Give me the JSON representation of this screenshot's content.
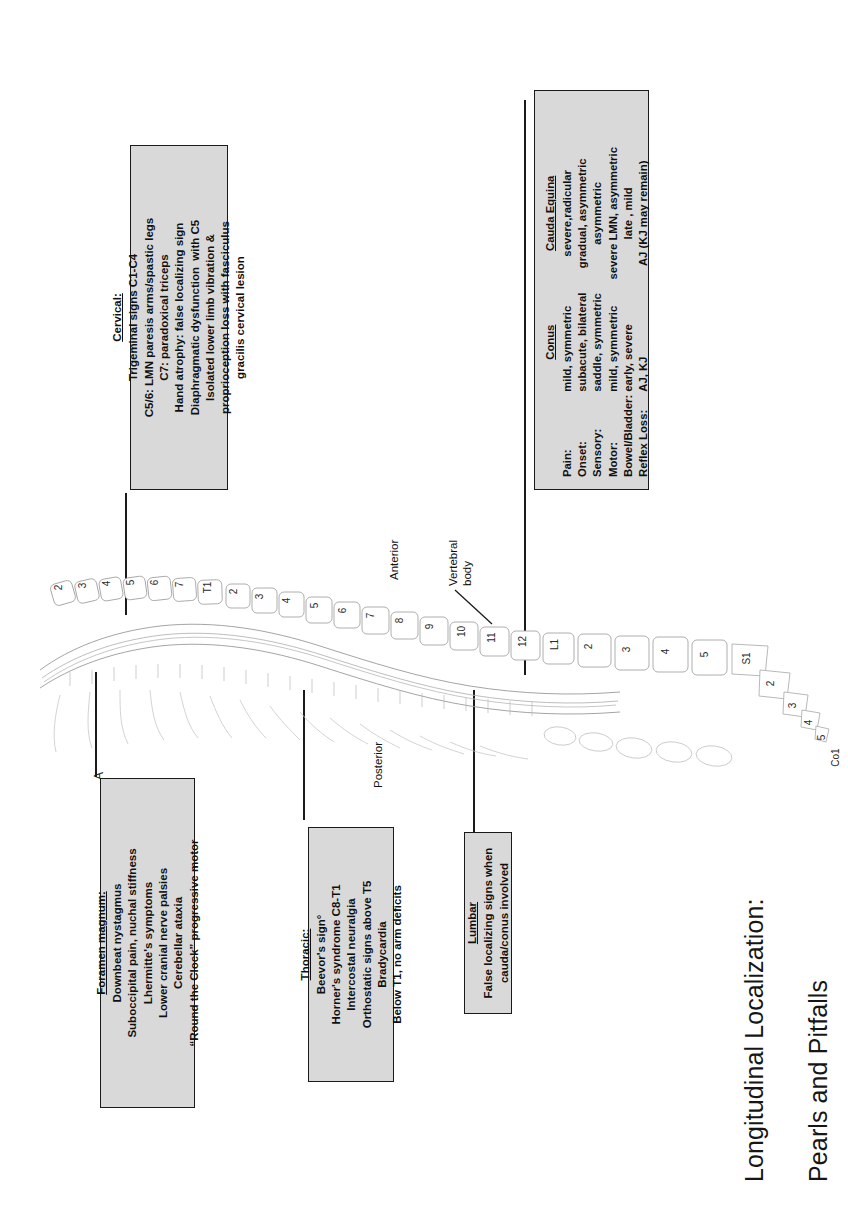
{
  "title": {
    "line1": "Longitudinal Localization:",
    "line2": "Pearls and Pitfalls"
  },
  "panel_letter": "A",
  "boxes": {
    "foramen_magnum": {
      "heading": "Foramen magnum:",
      "lines": [
        "Downbeat nystagmus",
        "Suboccipital pain, nuchal stiffness",
        "Lhermitte's symptoms",
        "Lower cranial nerve palsies",
        "Cerebellar ataxia",
        "“Round the Clock” progressive motor"
      ]
    },
    "thoracic": {
      "heading": "Thoracic:",
      "lines": [
        "Beevor's sign°",
        "Horner's syndrome C8-T1",
        "Intercostal neuralgia",
        "Orthostatic signs above T5",
        "Bradycardia",
        "Below T1, no arm deficits"
      ]
    },
    "lumbar": {
      "heading": "Lumbar",
      "lines": [
        "False localizing signs when",
        "cauda/conus involved"
      ]
    },
    "cervical": {
      "heading": "Cervical:",
      "lines": [
        "Trigeminal signs C1-C4",
        "C5/6: LMN paresis arms/spastic legs",
        "C7: paradoxical triceps",
        "Hand atrophy: false localizing sign",
        "Diaphragmatic dysfunction  with C5",
        "Isolated lower limb vibration &",
        "proprioception loss with fasciculus",
        "gracilis cervical lesion"
      ]
    },
    "conus_cauda": {
      "col1_heading": "Conus",
      "col2_heading": "Cauda Equina",
      "rows": [
        {
          "label": "Pain:",
          "conus": "mild, symmetric",
          "cauda": "severe,radicular"
        },
        {
          "label": "Onset:",
          "conus": "subacute, bilateral",
          "cauda": "gradual, asymmetric"
        },
        {
          "label": "Sensory:",
          "conus": "saddle, symmetric",
          "cauda": "asymmetric"
        },
        {
          "label": "Motor:",
          "conus": "mild, symmetric",
          "cauda": "severe LMN, asymmetric"
        },
        {
          "label": "Bowel/Bladder:",
          "conus": "early, severe",
          "cauda": "late , mild"
        },
        {
          "label": "Reflex Loss:",
          "conus": "AJ, KJ",
          "cauda": "AJ (KJ may remain)"
        }
      ]
    }
  },
  "spine": {
    "anterior_label": "Anterior",
    "posterior_label": "Posterior",
    "vertebral_body_label": "Vertebral\nbody",
    "cervical_numbers": [
      "2",
      "3",
      "4",
      "5",
      "6",
      "7",
      "T1"
    ],
    "thoracic_numbers": [
      "2",
      "3",
      "4",
      "5",
      "6",
      "7",
      "8",
      "9",
      "10",
      "11",
      "12"
    ],
    "lumbar_numbers": [
      "L1",
      "2",
      "3",
      "4",
      "5"
    ],
    "sacral_numbers": [
      "S1",
      "2",
      "3",
      "4",
      "5"
    ],
    "coccyx_label": "Co1"
  },
  "colors": {
    "box_fill": "#d9d9d9",
    "box_border": "#1a1a1a",
    "text": "#101010",
    "line": "#1a1a1a"
  }
}
